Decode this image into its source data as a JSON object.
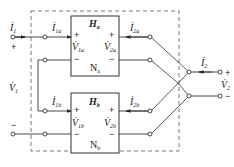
{
  "diagram": {
    "type": "circuit",
    "colors": {
      "line": "#333333",
      "dashed": "#555555",
      "background": "#ffffff"
    },
    "port1": {
      "current": {
        "main": "İ",
        "sub": "1"
      },
      "voltage": {
        "main": "V̇",
        "sub": "1"
      },
      "plus": "+",
      "minus": "−"
    },
    "port2": {
      "current": {
        "main": "İ",
        "sub": "2"
      },
      "voltage": {
        "main": "V̇",
        "sub": "2"
      },
      "plus": "+",
      "minus": "−"
    },
    "network_a": {
      "matrix": {
        "main": "H",
        "sub": "a"
      },
      "name": {
        "main": "N",
        "sub": "a"
      },
      "i1": {
        "main": "İ",
        "sub": "1a"
      },
      "i2": {
        "main": "İ",
        "sub": "2a"
      },
      "v1": {
        "main": "V̇",
        "sub": "1a"
      },
      "v2": {
        "main": "V̇",
        "sub": "2a"
      },
      "plus": "+",
      "minus": "−"
    },
    "network_b": {
      "matrix": {
        "main": "H",
        "sub": "b"
      },
      "name": {
        "main": "N",
        "sub": "b"
      },
      "i1": {
        "main": "İ",
        "sub": "1b"
      },
      "i2": {
        "main": "İ",
        "sub": "2b"
      },
      "v1": {
        "main": "V̇",
        "sub": "1b"
      },
      "v2": {
        "main": "V̇",
        "sub": "2b"
      },
      "plus": "+",
      "minus": "−"
    }
  }
}
